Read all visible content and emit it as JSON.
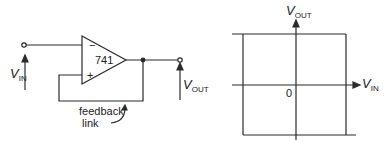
{
  "circuit": {
    "opamp_label": "741",
    "minus_sign": "−",
    "plus_sign": "+",
    "vin_main": "V",
    "vin_sub": "IN",
    "vout_main": "V",
    "vout_sub": "OUT",
    "feedback_line1": "feedback",
    "feedback_line2": "link"
  },
  "graph": {
    "y_axis_main": "V",
    "y_axis_sub": "OUT",
    "x_axis_main": "V",
    "x_axis_sub": "IN",
    "origin_label": "0"
  },
  "colors": {
    "stroke": "#2a2a2a",
    "background": "#ffffff"
  }
}
